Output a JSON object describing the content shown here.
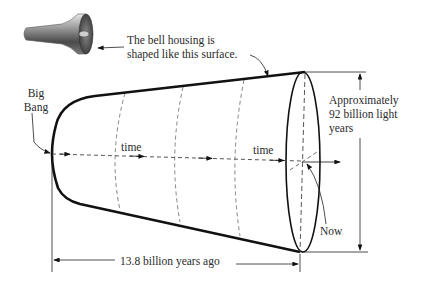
{
  "diagram": {
    "type": "cosmology-bell-shaped-universe",
    "colors": {
      "ink": "#111111",
      "dashed": "#666666",
      "text": "#2a2a2a",
      "background": "#ffffff"
    },
    "bell_icon": {
      "name": "bell-housing-icon"
    },
    "caption": {
      "line1": "The bell housing is",
      "line2": "shaped like this surface."
    },
    "big_bang": {
      "line1": "Big",
      "line2": "Bang"
    },
    "time_labels": [
      "time",
      "time"
    ],
    "now_label": "Now",
    "size_label": {
      "line1": "Approximately",
      "line2": "92 billion light",
      "line3": "years"
    },
    "age_label": "13.8 billion years ago"
  }
}
